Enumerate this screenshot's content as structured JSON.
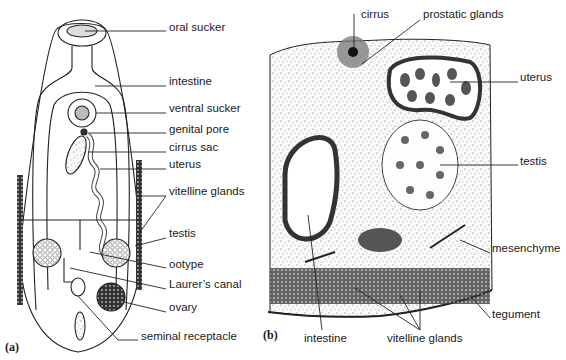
{
  "panel_a": {
    "letter": "(a)",
    "labels": [
      {
        "id": "oral-sucker",
        "text": "oral sucker",
        "x": 169,
        "y": 26
      },
      {
        "id": "intestine",
        "text": "intestine",
        "x": 169,
        "y": 80
      },
      {
        "id": "ventral-sucker",
        "text": "ventral sucker",
        "x": 169,
        "y": 107
      },
      {
        "id": "genital-pore",
        "text": "genital pore",
        "x": 169,
        "y": 128
      },
      {
        "id": "cirrus-sac",
        "text": "cirrus sac",
        "x": 169,
        "y": 146
      },
      {
        "id": "uterus",
        "text": "uterus",
        "x": 169,
        "y": 163
      },
      {
        "id": "vitelline-glands",
        "text": "vitelline glands",
        "x": 169,
        "y": 190
      },
      {
        "id": "testis",
        "text": "testis",
        "x": 169,
        "y": 232
      },
      {
        "id": "ootype",
        "text": "ootype",
        "x": 169,
        "y": 263
      },
      {
        "id": "laurers-canal",
        "text": "Laurer’s canal",
        "x": 169,
        "y": 283
      },
      {
        "id": "ovary",
        "text": "ovary",
        "x": 169,
        "y": 306
      },
      {
        "id": "seminal-receptacle",
        "text": "seminal receptacle",
        "x": 141,
        "y": 335
      }
    ]
  },
  "panel_b": {
    "letter": "(b)",
    "labels": [
      {
        "id": "cirrus",
        "text": "cirrus",
        "x": 361,
        "y": 13
      },
      {
        "id": "prostatic-glands",
        "text": "prostatic glands",
        "x": 423,
        "y": 13
      },
      {
        "id": "uterus-b",
        "text": "uterus",
        "x": 520,
        "y": 76
      },
      {
        "id": "testis-b",
        "text": "testis",
        "x": 520,
        "y": 160
      },
      {
        "id": "mesenchyme",
        "text": "mesenchyme",
        "x": 492,
        "y": 247
      },
      {
        "id": "tegument",
        "text": "tegument",
        "x": 492,
        "y": 313
      },
      {
        "id": "intestine-b",
        "text": "intestine",
        "x": 304,
        "y": 337
      },
      {
        "id": "vitelline-glands-b",
        "text": "vitelline glands",
        "x": 387,
        "y": 337
      }
    ]
  }
}
